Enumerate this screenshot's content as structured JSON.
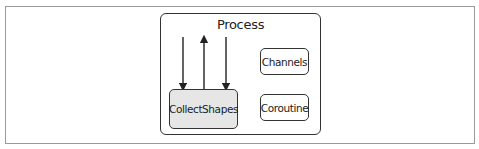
{
  "diagram": {
    "container": {
      "label": "Process"
    },
    "nodes": [
      {
        "id": "collect",
        "label": "CollectShapes",
        "fill": "#e6e6e6"
      },
      {
        "id": "channels",
        "label": "Channels",
        "fill": "#ffffff"
      },
      {
        "id": "coroutine",
        "label": "Coroutine",
        "fill": "#ffffff"
      }
    ],
    "arrows": [
      {
        "direction": "down",
        "target": "CollectShapes"
      },
      {
        "direction": "up",
        "source": "CollectShapes"
      },
      {
        "direction": "down",
        "target": "CollectShapes"
      }
    ],
    "colors": {
      "stroke": "#333333",
      "frame": "#9a9a9a",
      "node_fill": "#e6e6e6"
    }
  }
}
